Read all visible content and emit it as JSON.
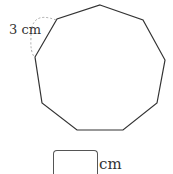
{
  "figure": {
    "shape": "regular nonagon",
    "side_label": "3 cm",
    "vertices": [
      [
        100,
        5
      ],
      [
        143,
        20
      ],
      [
        165,
        60
      ],
      [
        157,
        103
      ],
      [
        123,
        130
      ],
      [
        77,
        130
      ],
      [
        42,
        103
      ],
      [
        35,
        57
      ],
      [
        57,
        19
      ]
    ],
    "stroke_color": "#333333",
    "arc_color": "#aaaaaa"
  },
  "answer": {
    "value": "",
    "unit": "cm"
  }
}
